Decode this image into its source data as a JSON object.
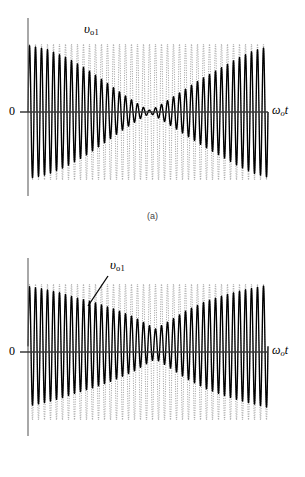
{
  "figure": {
    "kind": "two-panel waveform figure",
    "background": "#ffffff",
    "ink_color": "#000000",
    "carrier_color": "#9a9a9a",
    "axis_color": "#6e6e6e"
  },
  "panels": [
    {
      "id": "a",
      "caption": "(a)",
      "origin_label": "0",
      "x_axis_label_main": "ω",
      "x_axis_label_sub": "o",
      "x_axis_label_tail": "t",
      "signal_label_main": "υ",
      "signal_label_sub": "o1",
      "has_leader_line": false
    },
    {
      "id": "b",
      "caption": "(b)",
      "origin_label": "0",
      "x_axis_label_main": "ω",
      "x_axis_label_sub": "o",
      "x_axis_label_tail": "t",
      "signal_label_main": "υ",
      "signal_label_sub": "o1",
      "has_leader_line": true
    }
  ],
  "chart_data": {
    "type": "line",
    "title": "",
    "xlabel": "ωo t",
    "ylabel": "",
    "grid": false,
    "legend": "none",
    "xlim": [
      0,
      1
    ],
    "ylim": [
      -1,
      1
    ],
    "panels": [
      {
        "id": "a",
        "axis": {
          "x_start_px": 28,
          "x_end_px": 268,
          "y_zero_px": 112,
          "y_top_px": 18,
          "y_bottom_px": 196,
          "envelope_top_px": 44,
          "envelope_bottom_px": 180
        },
        "series": [
          {
            "name": "carrier",
            "style": "dotted-light",
            "carrier_cycles": 40,
            "amplitude_norm": 1.0,
            "modulation": "constant"
          },
          {
            "name": "v_o1",
            "style": "solid-bold",
            "carrier_cycles": 40,
            "amplitude_envelope_x": [
              0.0,
              0.08,
              0.16,
              0.24,
              0.32,
              0.4,
              0.48,
              0.51,
              0.56,
              0.64,
              0.72,
              0.8,
              0.88,
              0.94,
              1.0
            ],
            "amplitude_envelope_y": [
              0.98,
              0.92,
              0.8,
              0.64,
              0.45,
              0.25,
              0.07,
              0.02,
              0.12,
              0.3,
              0.48,
              0.64,
              0.8,
              0.9,
              0.96
            ],
            "node_position_norm": 0.51,
            "modulation": "single null near center, amplitude large at both ends"
          }
        ]
      },
      {
        "id": "b",
        "axis": {
          "x_start_px": 28,
          "x_end_px": 268,
          "y_zero_px": 112,
          "y_top_px": 18,
          "y_bottom_px": 196,
          "envelope_top_px": 44,
          "envelope_bottom_px": 180
        },
        "series": [
          {
            "name": "carrier",
            "style": "dotted-light",
            "carrier_cycles": 40,
            "amplitude_norm": 1.0,
            "modulation": "constant"
          },
          {
            "name": "v_o1",
            "style": "solid-bold",
            "carrier_cycles": 40,
            "amplitude_envelope_x": [
              0.0,
              0.06,
              0.13,
              0.2,
              0.28,
              0.36,
              0.44,
              0.5,
              0.53,
              0.58,
              0.66,
              0.74,
              0.82,
              0.9,
              1.0
            ],
            "amplitude_envelope_y": [
              0.88,
              0.84,
              0.78,
              0.7,
              0.62,
              0.52,
              0.4,
              0.28,
              0.22,
              0.32,
              0.5,
              0.64,
              0.74,
              0.82,
              0.9
            ],
            "node_position_norm": 0.53,
            "dc_offset_norm": 0.12,
            "modulation": "shallow null near center, offset upward; amplitude recovers toward right"
          }
        ]
      }
    ]
  }
}
